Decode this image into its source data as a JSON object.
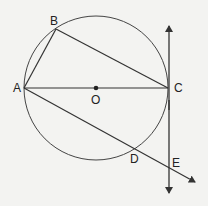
{
  "diagram": {
    "type": "circle-geometry",
    "circle": {
      "center": "O",
      "cx": 96,
      "cy": 88,
      "r": 72
    },
    "points": {
      "A": {
        "x": 24,
        "y": 88,
        "label": "A",
        "lx": 13,
        "ly": 92
      },
      "B": {
        "x": 56,
        "y": 29,
        "label": "B",
        "lx": 50,
        "ly": 25
      },
      "C": {
        "x": 168,
        "y": 88,
        "label": "C",
        "lx": 174,
        "ly": 92
      },
      "O": {
        "x": 96,
        "y": 88,
        "label": "O",
        "lx": 91,
        "ly": 103
      },
      "D": {
        "x": 135,
        "y": 147,
        "label": "D",
        "lx": 130,
        "ly": 163
      },
      "E": {
        "x": 169,
        "y": 167,
        "label": "E",
        "lx": 172,
        "ly": 167
      }
    },
    "segments": [
      "AB",
      "BC",
      "AC"
    ],
    "rays": [
      "A→D→E (extended)"
    ],
    "tangent_line": {
      "at": "C",
      "x": 169,
      "y1": 26,
      "y2": 193,
      "arrows": "both"
    },
    "colors": {
      "stroke": "#333333",
      "background": "#f3f3f1"
    }
  }
}
